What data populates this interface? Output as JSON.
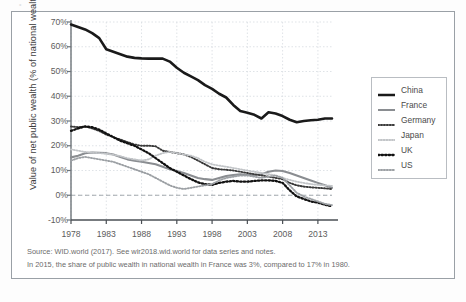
{
  "chart_data": {
    "type": "line",
    "title": "",
    "xlabel": "",
    "ylabel": "Value of net public wealth (% of national wealth)",
    "xlim": [
      1978,
      2015
    ],
    "ylim": [
      -10,
      70
    ],
    "ytick_labels": [
      "70%",
      "60%",
      "50%",
      "40%",
      "30%",
      "20%",
      "10%",
      "0%",
      "-10%"
    ],
    "ytick_values": [
      70,
      60,
      50,
      40,
      30,
      20,
      10,
      0,
      -10
    ],
    "xtick_labels": [
      "1978",
      "1983",
      "1988",
      "1993",
      "1998",
      "2003",
      "2008",
      "2013"
    ],
    "xtick_values": [
      1978,
      1983,
      1988,
      1993,
      1998,
      2003,
      2008,
      2013
    ],
    "grid": true,
    "legend_position": "right",
    "zero_reference_line": 0,
    "x": [
      1978,
      1979,
      1980,
      1981,
      1982,
      1983,
      1984,
      1985,
      1986,
      1987,
      1988,
      1989,
      1990,
      1991,
      1992,
      1993,
      1994,
      1995,
      1996,
      1997,
      1998,
      1999,
      2000,
      2001,
      2002,
      2003,
      2004,
      2005,
      2006,
      2007,
      2008,
      2009,
      2010,
      2011,
      2012,
      2013,
      2014,
      2015
    ],
    "series": [
      {
        "name": "China",
        "color": "#1a1a1a",
        "style": "solid",
        "width": 2.6,
        "values": [
          69,
          68,
          67,
          65.5,
          63.5,
          59,
          58,
          57,
          56,
          55.5,
          55.3,
          55.2,
          55.2,
          55.2,
          54,
          51.5,
          49.5,
          48,
          46.5,
          44.5,
          43,
          41,
          39.5,
          36.5,
          34,
          33.3,
          32.5,
          31,
          33.5,
          33,
          32,
          30.5,
          29.5,
          30,
          30.3,
          30.5,
          31,
          31
        ]
      },
      {
        "name": "France",
        "color": "#8a8d91",
        "style": "solid",
        "width": 2.1,
        "values": [
          15.3,
          16,
          17,
          17.3,
          17.2,
          17,
          16.5,
          15.5,
          14.5,
          14,
          13.5,
          13,
          12.5,
          11.5,
          10.5,
          9.8,
          9,
          8,
          7,
          6.5,
          6.2,
          7,
          7.8,
          8.2,
          8.5,
          8.3,
          8.2,
          8.5,
          9.5,
          10,
          9.8,
          9,
          8,
          7,
          6,
          5,
          4,
          3
        ]
      },
      {
        "name": "Germany",
        "color": "#3a3a3a",
        "style": "dotted",
        "width": 1.9,
        "values": [
          27.8,
          27.5,
          27.8,
          27,
          26,
          24.5,
          23.5,
          22.5,
          21.5,
          20.5,
          20,
          20,
          19.8,
          18,
          17.5,
          17,
          16.5,
          15.5,
          14,
          12.5,
          11,
          10.5,
          10.3,
          10,
          9.5,
          9,
          8.5,
          8,
          7.5,
          7,
          6.5,
          5,
          4,
          3.5,
          3.2,
          3,
          2.8,
          2.5
        ]
      },
      {
        "name": "Japan",
        "color": "#c2c5c8",
        "style": "dotted",
        "width": 1.8,
        "values": [
          18.5,
          18,
          17.5,
          17.2,
          17,
          16.8,
          16.3,
          15.8,
          15,
          14.5,
          14,
          14.5,
          16,
          17,
          17.5,
          17,
          16.5,
          16,
          15,
          13.5,
          12.5,
          12,
          11.5,
          11,
          10.5,
          10,
          9.5,
          9,
          8.5,
          8,
          7,
          6.2,
          5.5,
          5,
          4.5,
          4.2,
          4,
          3.8
        ]
      },
      {
        "name": "UK",
        "color": "#111111",
        "style": "dotted",
        "width": 2.3,
        "values": [
          26,
          27,
          27.8,
          27.5,
          26.5,
          25,
          23.5,
          22,
          21,
          20,
          18.5,
          17,
          15,
          13,
          11,
          9.5,
          8,
          6.5,
          5.2,
          4.5,
          4.2,
          5,
          5.5,
          5.8,
          5.5,
          5.5,
          5.8,
          6,
          6,
          5.8,
          5,
          2,
          -0.5,
          -1.5,
          -2.5,
          -3,
          -3.8,
          -4.5
        ]
      },
      {
        "name": "US",
        "color": "#9ca0a4",
        "style": "dotted",
        "width": 1.9,
        "values": [
          14,
          15,
          15.5,
          15,
          14.5,
          14,
          13.5,
          12.5,
          11.5,
          10.5,
          9.5,
          8.5,
          7,
          5.5,
          4,
          3,
          2.5,
          3,
          3.5,
          4,
          4.5,
          6,
          7,
          7.5,
          8,
          8,
          7.5,
          7,
          7.5,
          8,
          7,
          4,
          1,
          -0.5,
          -1.5,
          -2.5,
          -3.5,
          -4
        ]
      }
    ]
  },
  "legend": {
    "items": [
      {
        "label": "China"
      },
      {
        "label": "France"
      },
      {
        "label": "Germany"
      },
      {
        "label": "Japan"
      },
      {
        "label": "UK"
      },
      {
        "label": "US"
      }
    ]
  },
  "notes": {
    "source": "Source: WID.world (2017). See wir2018.wid.world for data series and notes.",
    "note": "In 2015, the share of public wealth in national wealth in France was 3%, compared to 17% in 1980."
  },
  "caption": {
    "text": ""
  }
}
